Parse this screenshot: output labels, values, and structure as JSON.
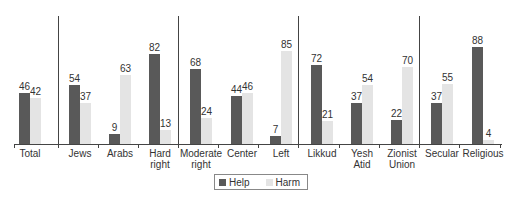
{
  "chart_data": {
    "type": "bar",
    "title": "",
    "xlabel": "",
    "ylabel": "",
    "ylim": [
      0,
      100
    ],
    "grid": false,
    "legend_position": "bottom",
    "categories": [
      "Total",
      "Jews",
      "Arabs",
      "Hard right",
      "Moderate right",
      "Center",
      "Left",
      "Likkud",
      "Yesh Atid",
      "Zionist Union",
      "Secular",
      "Religious"
    ],
    "category_lines": [
      [
        "Total"
      ],
      [
        "Jews"
      ],
      [
        "Arabs"
      ],
      [
        "Hard",
        "right"
      ],
      [
        "Moderate",
        "right"
      ],
      [
        "Center"
      ],
      [
        "Left"
      ],
      [
        "Likkud"
      ],
      [
        "Yesh",
        "Atid"
      ],
      [
        "Zionist",
        "Union"
      ],
      [
        "Secular"
      ],
      [
        "Religious"
      ]
    ],
    "groups": [
      [
        "Total"
      ],
      [
        "Jews",
        "Arabs"
      ],
      [
        "Hard right",
        "Moderate right",
        "Center",
        "Left"
      ],
      [
        "Likkud",
        "Yesh Atid",
        "Zionist Union"
      ],
      [
        "Secular",
        "Religious"
      ]
    ],
    "series": [
      {
        "name": "Help",
        "color": "#595959",
        "values": [
          46,
          54,
          9,
          82,
          68,
          44,
          7,
          72,
          37,
          22,
          37,
          88
        ]
      },
      {
        "name": "Harm",
        "color": "#e4e4e4",
        "values": [
          42,
          37,
          63,
          13,
          24,
          46,
          85,
          21,
          54,
          70,
          55,
          4
        ]
      }
    ]
  },
  "legend": {
    "help_label": "Help",
    "harm_label": "Harm"
  }
}
